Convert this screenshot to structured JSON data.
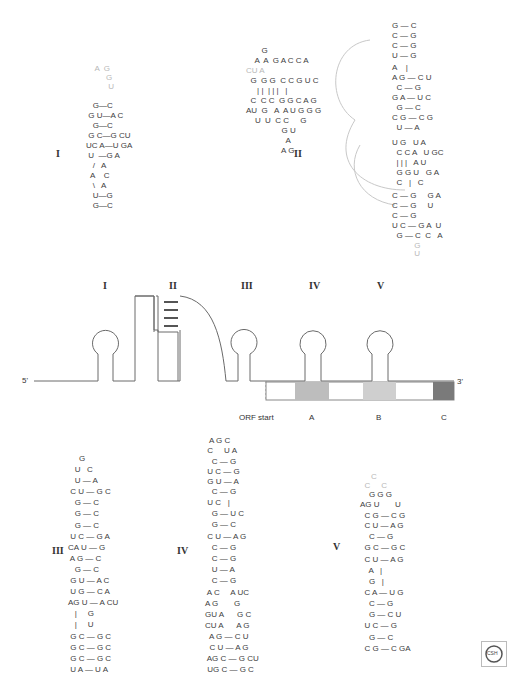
{
  "domains": [
    "I",
    "II",
    "III",
    "IV",
    "V"
  ],
  "schematic": {
    "five_prime": "5'",
    "three_prime": "3'",
    "orf_start": "ORF start",
    "regions": [
      "A",
      "B",
      "C"
    ],
    "region_colors": {
      "A": "#bdbdbd",
      "B": "#cfcfcf",
      "C": "#7a7a7a"
    }
  },
  "structure_I": {
    "label": "I",
    "rows": [
      {
        "t": "    A  G  ",
        "f": true
      },
      {
        "t": "         G",
        "f": true
      },
      {
        "t": "          U",
        "f": true
      },
      {
        "t": "   G—C",
        "f": false
      },
      {
        "t": " G U—A C",
        "f": false
      },
      {
        "t": "   G—C",
        "f": false
      },
      {
        "t": " G C—G CU",
        "f": false
      },
      {
        "t": "UC A—U GA",
        "f": false
      },
      {
        "t": " U  —G A",
        "f": false
      },
      {
        "t": "   /   A",
        "f": false
      },
      {
        "t": "  A    C",
        "f": false
      },
      {
        "t": "   \\   A",
        "f": false
      },
      {
        "t": "   U—G",
        "f": false
      },
      {
        "t": "   G—C",
        "f": false
      }
    ]
  },
  "structure_II": {
    "label": "II",
    "left_rows": [
      "       G",
      "    A  A  G A C C A",
      "CU A   ",
      "  G  G G  C C G U C",
      "     | |  | | |   |",
      "  C  C C  G G C A G",
      "AU  G   A  A U G G G",
      "    U  U  C C     G",
      "                G U",
      "                  A",
      "                A G"
    ],
    "right_rows": [
      "G — C",
      "C — G",
      "C — G",
      "U — G",
      "A    |",
      "A G — C U",
      "  C — G",
      "G A — U C",
      "  G — C",
      "C G — C G",
      "  U — A",
      "U G   U A",
      "  C C A   U GC",
      "  | | |   A U",
      "  G G U   G A",
      "  C   |   C",
      "C — G     G A",
      "C — G     U",
      "C — G",
      "U C — G A  U",
      "  G — C  C   A",
      "          G",
      "          U"
    ]
  },
  "structure_III": {
    "label": "III",
    "rows": [
      "     G",
      "   U   C",
      "   U — A",
      " C U — G C",
      "   G — C",
      "   G — C",
      "   G — C",
      " U C — G A",
      "CA U — G",
      " A G — C",
      "   G — C",
      " G U — A C",
      " U G — C A",
      "AG U — A CU",
      "   |     G",
      "   |     U",
      " G C — G C",
      " G C — G C",
      " G C — G C",
      " U A — U A"
    ]
  },
  "structure_IV": {
    "label": "IV",
    "rows": [
      "  A G C",
      " C     U A",
      "   C — G",
      " U C — G",
      " G U — A",
      "   C — G",
      " U C   |",
      "   G — U C",
      "   G — C",
      " C U — A G",
      "   C — G",
      "   C — G",
      "   U — A",
      "   C — G",
      " A C     A UC",
      "A G       G",
      "GU A      G C",
      "CU A      A G",
      "  A G — C U",
      "  C U — A G",
      " AG C — G CU",
      " UG C — G C"
    ]
  },
  "structure_V": {
    "label": "V",
    "rows": [
      "     C",
      "  C     C",
      "    G G G",
      "AG U       U",
      "  C G — C G",
      "  C U — A G",
      "    C — G",
      "  G C — G C",
      "  C U — A G",
      "    A   |",
      "    G   |",
      "  C A — U G",
      "    C — G",
      "    G — C U",
      "  U C — G",
      "    G — C",
      "  C G — C GA"
    ]
  },
  "logo": {
    "text": "CSH"
  }
}
